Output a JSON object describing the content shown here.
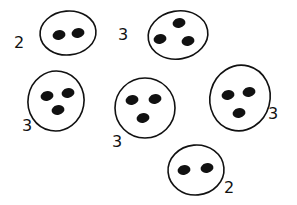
{
  "diagram": {
    "colors": {
      "ink": "#111111",
      "background": "#ffffff"
    },
    "groups": [
      {
        "label": "2",
        "dot_count": 2,
        "cx": 68,
        "cy": 33,
        "rx": 28,
        "ry": 22,
        "rot": -5,
        "dots": [
          [
            59,
            35
          ],
          [
            78,
            33
          ]
        ],
        "label_pos": [
          14,
          48
        ]
      },
      {
        "label": "3",
        "dot_count": 3,
        "cx": 178,
        "cy": 35,
        "rx": 30,
        "ry": 24,
        "rot": -10,
        "dots": [
          [
            179,
            23
          ],
          [
            160,
            39
          ],
          [
            188,
            41
          ]
        ],
        "label_pos": [
          118,
          40
        ]
      },
      {
        "label": "3",
        "dot_count": 3,
        "cx": 56,
        "cy": 101,
        "rx": 28,
        "ry": 30,
        "rot": 10,
        "dots": [
          [
            47,
            96
          ],
          [
            68,
            93
          ],
          [
            58,
            110
          ]
        ],
        "label_pos": [
          22,
          131
        ]
      },
      {
        "label": "3",
        "dot_count": 3,
        "cx": 145,
        "cy": 108,
        "rx": 30,
        "ry": 30,
        "rot": 0,
        "dots": [
          [
            132,
            100
          ],
          [
            155,
            99
          ],
          [
            143,
            118
          ]
        ],
        "label_pos": [
          112,
          147
        ]
      },
      {
        "label": "3",
        "dot_count": 3,
        "cx": 240,
        "cy": 98,
        "rx": 30,
        "ry": 33,
        "rot": 15,
        "dots": [
          [
            228,
            95
          ],
          [
            249,
            92
          ],
          [
            239,
            113
          ]
        ],
        "label_pos": [
          268,
          119
        ]
      },
      {
        "label": "2",
        "dot_count": 2,
        "cx": 196,
        "cy": 170,
        "rx": 28,
        "ry": 25,
        "rot": -5,
        "dots": [
          [
            184,
            170
          ],
          [
            207,
            168
          ]
        ],
        "label_pos": [
          224,
          193
        ]
      }
    ]
  }
}
